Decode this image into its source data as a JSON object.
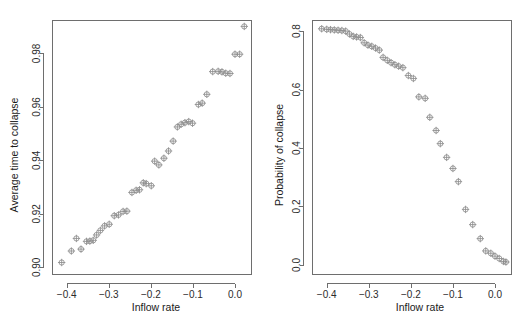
{
  "figure": {
    "panels": [
      {
        "id": "left",
        "xlabel": "Inflow rate",
        "ylabel": "Average time to collapse",
        "xticks": [
          "-0.4",
          "-0.3",
          "-0.2",
          "-0.1",
          "0.0"
        ],
        "yticks": [
          "0.90",
          "0.92",
          "0.94",
          "0.96",
          "0.98"
        ]
      },
      {
        "id": "right",
        "xlabel": "Inflow rate",
        "ylabel": "Probability of collapse",
        "xticks": [
          "-0.4",
          "-0.3",
          "-0.2",
          "-0.1",
          "0.0"
        ],
        "yticks": [
          "0.0",
          "0.2",
          "0.4",
          "0.6",
          "0.8"
        ]
      }
    ],
    "marker_color": "#8c8c8c",
    "axis_color": "#6e6e6e",
    "background": "#ffffff"
  },
  "chart_data": [
    {
      "type": "scatter",
      "panel": "left",
      "title": "",
      "xlabel": "Inflow rate",
      "ylabel": "Average time to collapse",
      "xlim": [
        -0.435,
        0.038
      ],
      "ylim": [
        0.8975,
        0.9925
      ],
      "xticks": [
        -0.4,
        -0.3,
        -0.2,
        -0.1,
        0.0
      ],
      "yticks": [
        0.9,
        0.92,
        0.94,
        0.96,
        0.98
      ],
      "grid": false,
      "legend": null,
      "marker": "circle-plus",
      "x": [
        -0.412,
        -0.389,
        -0.377,
        -0.366,
        -0.353,
        -0.345,
        -0.337,
        -0.329,
        -0.32,
        -0.31,
        -0.299,
        -0.287,
        -0.277,
        -0.266,
        -0.257,
        -0.245,
        -0.235,
        -0.227,
        -0.218,
        -0.211,
        -0.199,
        -0.191,
        -0.181,
        -0.169,
        -0.158,
        -0.147,
        -0.137,
        -0.128,
        -0.119,
        -0.11,
        -0.101,
        -0.087,
        -0.078,
        -0.067,
        -0.053,
        -0.04,
        -0.031,
        -0.022,
        -0.012,
        0.0,
        0.011,
        0.022
      ],
      "y": [
        0.9018,
        0.9061,
        0.9108,
        0.9068,
        0.9097,
        0.9098,
        0.9101,
        0.9121,
        0.9138,
        0.9155,
        0.9161,
        0.9193,
        0.9196,
        0.9209,
        0.921,
        0.928,
        0.9288,
        0.929,
        0.9316,
        0.9313,
        0.9305,
        0.9397,
        0.9383,
        0.9408,
        0.9435,
        0.9472,
        0.9525,
        0.9535,
        0.9541,
        0.9545,
        0.9539,
        0.9609,
        0.9614,
        0.9647,
        0.9732,
        0.9733,
        0.9731,
        0.9726,
        0.9725,
        0.9797,
        0.9797,
        0.9901
      ]
    },
    {
      "type": "scatter",
      "panel": "right",
      "title": "",
      "xlabel": "Inflow rate",
      "ylabel": "Probability of collapse",
      "xlim": [
        -0.435,
        0.038
      ],
      "ylim": [
        -0.031,
        0.838
      ],
      "xticks": [
        -0.4,
        -0.3,
        -0.2,
        -0.1,
        0.0
      ],
      "yticks": [
        0.0,
        0.2,
        0.4,
        0.6,
        0.8
      ],
      "grid": false,
      "legend": null,
      "marker": "circle-plus",
      "x": [
        -0.412,
        -0.4,
        -0.391,
        -0.382,
        -0.373,
        -0.364,
        -0.355,
        -0.346,
        -0.337,
        -0.329,
        -0.32,
        -0.311,
        -0.302,
        -0.293,
        -0.284,
        -0.275,
        -0.266,
        -0.256,
        -0.247,
        -0.238,
        -0.229,
        -0.219,
        -0.206,
        -0.194,
        -0.181,
        -0.166,
        -0.155,
        -0.14,
        -0.13,
        -0.115,
        -0.1,
        -0.087,
        -0.07,
        -0.053,
        -0.035,
        -0.022,
        -0.01,
        0.0,
        0.01,
        0.02,
        0.026
      ],
      "y": [
        0.808,
        0.806,
        0.805,
        0.804,
        0.803,
        0.802,
        0.8,
        0.79,
        0.782,
        0.78,
        0.778,
        0.76,
        0.752,
        0.748,
        0.742,
        0.735,
        0.71,
        0.7,
        0.692,
        0.685,
        0.68,
        0.675,
        0.648,
        0.638,
        0.575,
        0.57,
        0.505,
        0.46,
        0.415,
        0.368,
        0.33,
        0.285,
        0.19,
        0.138,
        0.09,
        0.048,
        0.04,
        0.03,
        0.022,
        0.012,
        0.01
      ]
    }
  ],
  "caption": {
    "text": ""
  }
}
